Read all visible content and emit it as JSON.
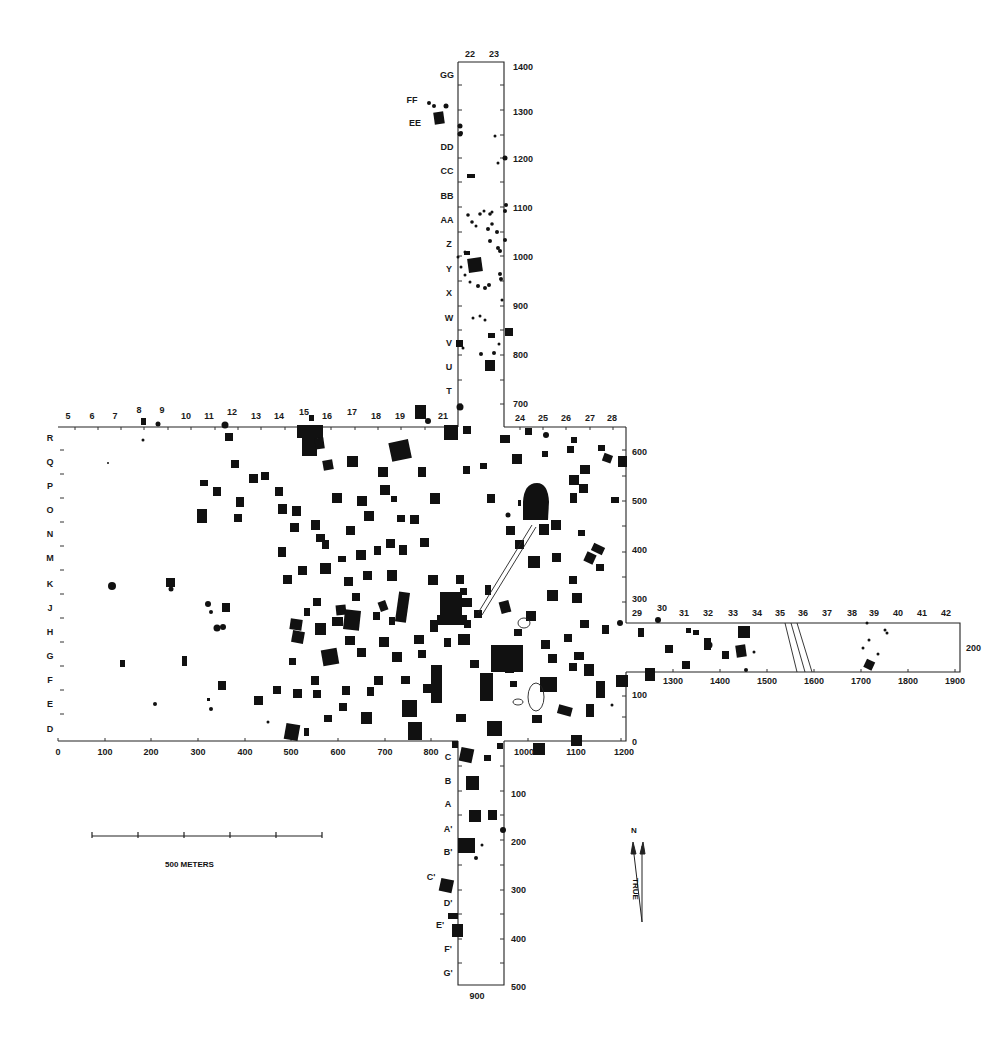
{
  "map": {
    "title": "Archaeological site plan (survey grid)",
    "colors": {
      "background": "#ffffff",
      "ink": "#111111"
    },
    "north_arm": {
      "column_labels": [
        "22",
        "23"
      ],
      "row_labels": [
        "GG",
        "FF",
        "EE",
        "DD",
        "CC",
        "BB",
        "AA",
        "Z",
        "Y",
        "X",
        "W",
        "V",
        "U",
        "T"
      ],
      "right_axis_ticks": [
        "1400",
        "1300",
        "1200",
        "1100",
        "1000",
        "900",
        "800",
        "700"
      ]
    },
    "main_block": {
      "column_labels_left": [
        "5",
        "6",
        "7",
        "8",
        "9",
        "10",
        "11",
        "12",
        "13",
        "14",
        "15",
        "16",
        "17",
        "18",
        "19",
        "21"
      ],
      "column_labels_right": [
        "24",
        "25",
        "26",
        "27",
        "28"
      ],
      "row_labels": [
        "R",
        "Q",
        "P",
        "O",
        "N",
        "M",
        "K",
        "J",
        "H",
        "G",
        "F",
        "E",
        "D"
      ],
      "right_axis_ticks": [
        "600",
        "500",
        "400",
        "300",
        "100",
        "0"
      ],
      "bottom_axis_ticks": [
        "0",
        "100",
        "200",
        "300",
        "400",
        "500",
        "600",
        "700",
        "800",
        "1000",
        "1100",
        "1200"
      ]
    },
    "east_arm": {
      "column_labels": [
        "29",
        "30",
        "31",
        "32",
        "33",
        "34",
        "35",
        "36",
        "37",
        "38",
        "39",
        "40",
        "41",
        "42"
      ],
      "right_axis_tick": "200",
      "bottom_axis_ticks": [
        "1300",
        "1400",
        "1500",
        "1600",
        "1700",
        "1800",
        "1900"
      ]
    },
    "south_arm": {
      "row_labels": [
        "C",
        "B",
        "A",
        "A'",
        "B'",
        "C'",
        "D'",
        "E'",
        "F'",
        "G'"
      ],
      "right_axis_ticks": [
        "100",
        "200",
        "300",
        "400",
        "500"
      ],
      "bottom_axis_tick": "900"
    },
    "scale_bar": {
      "label": "500 METERS",
      "segments": 5
    },
    "north_arrow": {
      "magnetic_label": "N",
      "true_label": "TRUE"
    }
  }
}
